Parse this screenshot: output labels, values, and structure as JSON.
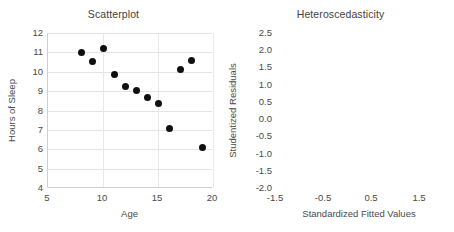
{
  "page": {
    "background_color": "#ffffff",
    "point_color": "#101010",
    "grid_color": "#e4e4e4",
    "axis_color": "#cfcfcf",
    "text_color": "#4a4a4a"
  },
  "chart_data": [
    {
      "type": "scatter",
      "title": "Scatterplot",
      "xlabel": "Age",
      "ylabel": "Hours of Sleep",
      "xlim": [
        5,
        20
      ],
      "ylim": [
        4,
        12
      ],
      "xticks": [
        5,
        10,
        15,
        20
      ],
      "xtick_labels": [
        "5",
        "10",
        "15",
        "20"
      ],
      "yticks": [
        4,
        5,
        6,
        7,
        8,
        9,
        10,
        11,
        12
      ],
      "ytick_labels": [
        "4",
        "5",
        "6",
        "7",
        "8",
        "9",
        "10",
        "11",
        "12"
      ],
      "grid": "horizontal-and-vertical",
      "legend": "none",
      "points": [
        {
          "x": 8,
          "y": 11.0
        },
        {
          "x": 9,
          "y": 10.55
        },
        {
          "x": 10,
          "y": 11.2
        },
        {
          "x": 11,
          "y": 9.85
        },
        {
          "x": 12,
          "y": 9.25
        },
        {
          "x": 13,
          "y": 9.05
        },
        {
          "x": 14,
          "y": 8.65
        },
        {
          "x": 15,
          "y": 8.35
        },
        {
          "x": 16,
          "y": 7.05
        },
        {
          "x": 17,
          "y": 10.1
        },
        {
          "x": 18,
          "y": 10.6
        },
        {
          "x": 19,
          "y": 6.1
        }
      ]
    },
    {
      "type": "scatter",
      "title": "Heteroscedasticity",
      "xlabel": "Standardized Fitted Values",
      "ylabel": "Studentized Residuals",
      "xlim": [
        -1.5,
        2.0
      ],
      "ylim": [
        -2.0,
        2.5
      ],
      "xticks": [
        -1.5,
        -0.5,
        0.5,
        1.5
      ],
      "xtick_labels": [
        "-1.5",
        "-0.5",
        "0.5",
        "1.5"
      ],
      "yticks": [
        -2.0,
        -1.5,
        -1.0,
        -0.5,
        0.0,
        0.5,
        1.0,
        1.5,
        2.0,
        2.5
      ],
      "ytick_labels": [
        "-2.0",
        "-1.5",
        "-1.0",
        "-0.5",
        "0.0",
        "0.5",
        "1.0",
        "1.5",
        "2.0",
        "2.5"
      ],
      "grid": "horizontal-and-vertical",
      "legend": "none",
      "points": [
        {
          "x": -1.38,
          "y": 2.22
        },
        {
          "x": -1.01,
          "y": 1.47
        },
        {
          "x": -0.78,
          "y": -1.28
        },
        {
          "x": -0.43,
          "y": -0.44
        },
        {
          "x": -0.21,
          "y": -0.41
        },
        {
          "x": 0.01,
          "y": -0.3
        },
        {
          "x": 0.23,
          "y": -0.37
        },
        {
          "x": 0.57,
          "y": -0.1
        },
        {
          "x": 0.99,
          "y": 0.85
        },
        {
          "x": 1.26,
          "y": 0.02
        },
        {
          "x": 1.52,
          "y": 0.22
        }
      ]
    }
  ]
}
